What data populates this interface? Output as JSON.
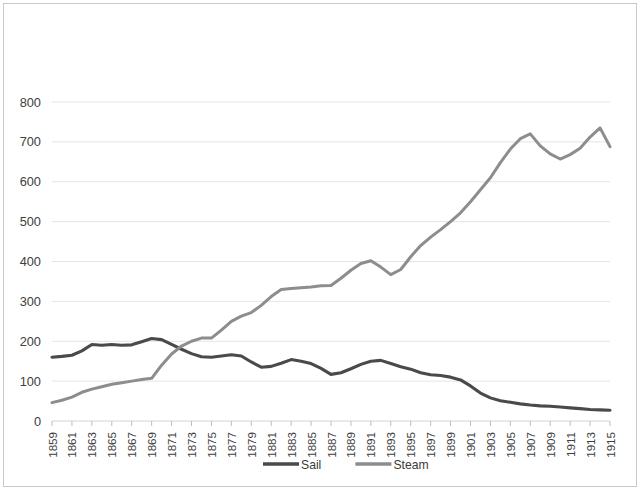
{
  "chart_data": {
    "type": "line",
    "title": "",
    "xlabel": "",
    "ylabel": "",
    "ylim": [
      0,
      800
    ],
    "ytick_step": 100,
    "yticks": [
      "0",
      "100",
      "200",
      "300",
      "400",
      "500",
      "600",
      "700",
      "800"
    ],
    "grid": true,
    "legend_position": "bottom",
    "x": [
      1859,
      1860,
      1861,
      1862,
      1863,
      1864,
      1865,
      1866,
      1867,
      1868,
      1869,
      1870,
      1871,
      1872,
      1873,
      1874,
      1875,
      1876,
      1877,
      1878,
      1879,
      1880,
      1881,
      1882,
      1883,
      1884,
      1885,
      1886,
      1887,
      1888,
      1889,
      1890,
      1891,
      1892,
      1893,
      1894,
      1895,
      1896,
      1897,
      1898,
      1899,
      1900,
      1901,
      1902,
      1903,
      1904,
      1905,
      1906,
      1907,
      1908,
      1909,
      1910,
      1911,
      1912,
      1913,
      1914,
      1915
    ],
    "xtick_labels": [
      "1859",
      "1861",
      "1863",
      "1865",
      "1867",
      "1869",
      "1871",
      "1873",
      "1875",
      "1877",
      "1879",
      "1881",
      "1883",
      "1885",
      "1887",
      "1889",
      "1891",
      "1893",
      "1895",
      "1897",
      "1899",
      "1901",
      "1903",
      "1905",
      "1907",
      "1909",
      "1911",
      "1913",
      "1915"
    ],
    "series": [
      {
        "name": "Sail",
        "color": "#4a4a4a",
        "values": [
          160,
          162,
          165,
          176,
          192,
          190,
          192,
          190,
          191,
          199,
          207,
          204,
          192,
          180,
          169,
          161,
          160,
          163,
          166,
          163,
          148,
          135,
          137,
          145,
          154,
          150,
          144,
          132,
          117,
          121,
          131,
          142,
          150,
          152,
          144,
          136,
          130,
          121,
          116,
          114,
          110,
          103,
          88,
          70,
          58,
          51,
          47,
          43,
          40,
          38,
          37,
          35,
          33,
          31,
          29,
          28,
          27
        ]
      },
      {
        "name": "Steam",
        "color": "#8d8d8d",
        "values": [
          46,
          52,
          60,
          72,
          80,
          86,
          92,
          96,
          100,
          104,
          107,
          140,
          168,
          188,
          200,
          208,
          208,
          228,
          250,
          263,
          272,
          290,
          312,
          330,
          332,
          334,
          336,
          339,
          340,
          358,
          378,
          395,
          402,
          386,
          367,
          380,
          412,
          440,
          461,
          480,
          500,
          522,
          550,
          580,
          610,
          648,
          682,
          708,
          720,
          690,
          670,
          657,
          668,
          684,
          712,
          735,
          688
        ]
      }
    ]
  },
  "legend": {
    "items": [
      {
        "label": "Sail",
        "color": "#4a4a4a"
      },
      {
        "label": "Steam",
        "color": "#8d8d8d"
      }
    ]
  }
}
